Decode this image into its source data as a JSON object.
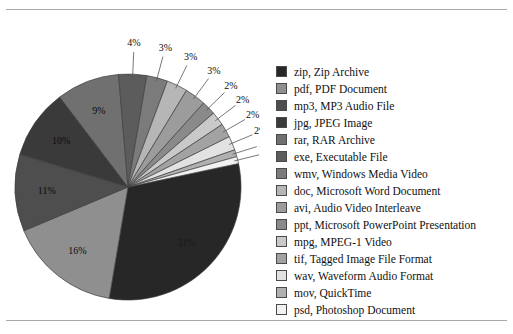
{
  "chart_data": {
    "type": "pie",
    "title": "",
    "legend_position": "right",
    "labels": [
      "zip, Zip Archive",
      "pdf, PDF Document",
      "mp3, MP3 Audio File",
      "jpg, JPEG Image",
      "rar, RAR Archive",
      "exe, Executable File",
      "wmv, Windows Media Video",
      "doc, Microsoft Word Document",
      "avi, Audio Video Interleave",
      "ppt, Microsoft PowerPoint Presentation",
      "mpg, MPEG-1 Video",
      "tif, Tagged Image File Format",
      "wav, Waveform Audio Format",
      "mov, QuickTime",
      "psd, Photoshop Document"
    ],
    "extensions": [
      "zip",
      "pdf",
      "mp3",
      "jpg",
      "rar",
      "exe",
      "wmv",
      "doc",
      "avi",
      "ppt",
      "mpg",
      "tif",
      "wav",
      "mov",
      "psd"
    ],
    "values": [
      31,
      16,
      11,
      10,
      9,
      4,
      3,
      3,
      3,
      2,
      2,
      2,
      2,
      1,
      1
    ],
    "value_labels": [
      "31%",
      "16%",
      "11%",
      "10%",
      "9%",
      "4%",
      "3%",
      "3%",
      "3%",
      "2%",
      "2%",
      "2%",
      "2%",
      "1%",
      "1%"
    ],
    "unit": "%",
    "colors": [
      "#272727",
      "#8f8f8f",
      "#4e4e4e",
      "#3a3a3a",
      "#707070",
      "#5c5c5c",
      "#7b7b7b",
      "#b6b6b6",
      "#9c9c9c",
      "#8a8a8a",
      "#c9c9c9",
      "#a2a2a2",
      "#e2e2e2",
      "#b0b0b0",
      "#f1f1f1"
    ]
  },
  "legend": {
    "items": [
      {
        "label": "zip, Zip Archive",
        "color": "#272727"
      },
      {
        "label": "pdf, PDF Document",
        "color": "#8f8f8f"
      },
      {
        "label": "mp3, MP3 Audio File",
        "color": "#4e4e4e"
      },
      {
        "label": "jpg, JPEG Image",
        "color": "#3a3a3a"
      },
      {
        "label": "rar, RAR Archive",
        "color": "#707070"
      },
      {
        "label": "exe, Executable File",
        "color": "#5c5c5c"
      },
      {
        "label": "wmv, Windows Media Video",
        "color": "#7b7b7b"
      },
      {
        "label": "doc, Microsoft Word Document",
        "color": "#b6b6b6"
      },
      {
        "label": "avi, Audio Video Interleave",
        "color": "#9c9c9c"
      },
      {
        "label": "ppt, Microsoft PowerPoint Presentation",
        "color": "#8a8a8a"
      },
      {
        "label": "mpg, MPEG-1 Video",
        "color": "#c9c9c9"
      },
      {
        "label": "tif, Tagged Image File Format",
        "color": "#a2a2a2"
      },
      {
        "label": "wav, Waveform Audio Format",
        "color": "#e2e2e2"
      },
      {
        "label": "mov, QuickTime",
        "color": "#b0b0b0"
      },
      {
        "label": "psd, Photoshop Document",
        "color": "#f1f1f1"
      }
    ]
  }
}
